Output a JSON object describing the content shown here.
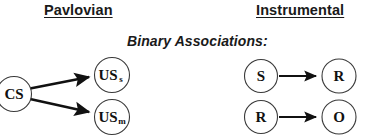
{
  "figure": {
    "width": 373,
    "height": 138,
    "background": "#ffffff",
    "stroke_color": "#111111",
    "circle_stroke_color": "#3a3a3a",
    "text_color": "#1a1a1a"
  },
  "columns": {
    "left_title": "Pavlovian",
    "right_title": "Instrumental"
  },
  "subtitle": "Binary Associations:",
  "pavlovian": {
    "source_node": {
      "label": "CS",
      "subscript": ""
    },
    "target_nodes": [
      {
        "label": "US",
        "subscript": "s"
      },
      {
        "label": "US",
        "subscript": "m"
      }
    ],
    "arrows": [
      {
        "from": "CS",
        "to": "USs"
      },
      {
        "from": "CS",
        "to": "USm"
      }
    ]
  },
  "instrumental": {
    "rows": [
      {
        "from": {
          "label": "S",
          "subscript": ""
        },
        "to": {
          "label": "R",
          "subscript": ""
        }
      },
      {
        "from": {
          "label": "R",
          "subscript": ""
        },
        "to": {
          "label": "O",
          "subscript": ""
        }
      }
    ]
  }
}
